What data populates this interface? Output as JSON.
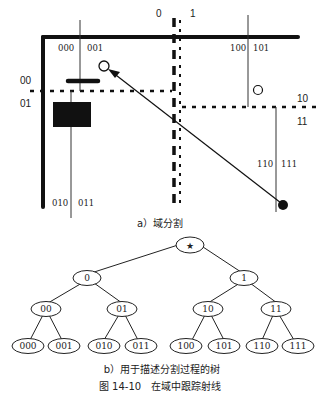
{
  "figure": {
    "subfigure_a": {
      "caption": "a）域分割",
      "split_labels": {
        "top_left_half": "0",
        "top_right_half": "1",
        "left_00": "00",
        "left_01": "01",
        "right_10": "10",
        "right_11": "11"
      },
      "region_labels": [
        "000",
        "001",
        "010",
        "011",
        "100",
        "101",
        "110",
        "111"
      ]
    },
    "subfigure_b": {
      "caption": "b）用于描述分割过程的树",
      "root": "★",
      "level1": [
        "0",
        "1"
      ],
      "level2": [
        "00",
        "01",
        "10",
        "11"
      ],
      "level3": [
        "000",
        "001",
        "010",
        "011",
        "100",
        "101",
        "110",
        "111"
      ]
    },
    "title": "图 14-10　在域中跟踪射线"
  }
}
